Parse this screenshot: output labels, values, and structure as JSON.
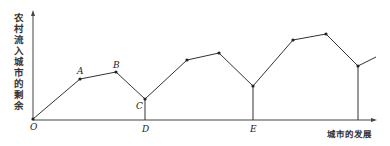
{
  "diagram": {
    "y_axis_label": "农村流入城市的剩余",
    "x_axis_label": "城市的发展",
    "labels": {
      "origin": "O",
      "A": "A",
      "B": "B",
      "C": "C",
      "D": "D",
      "E": "E"
    },
    "colors": {
      "line": "#333333",
      "axis": "#444444",
      "text": "#222222"
    }
  }
}
